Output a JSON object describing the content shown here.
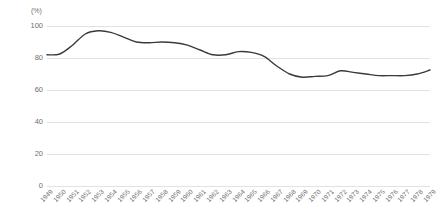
{
  "chart_data": {
    "type": "line",
    "title": "",
    "subtitle": "",
    "xlabel": "",
    "ylabel": "",
    "yunit": "(%)",
    "ylim": [
      0,
      100
    ],
    "yticks": [
      0,
      20,
      40,
      60,
      80,
      100
    ],
    "ytick_labels": [
      "0",
      "20",
      "40",
      "60",
      "80",
      "100"
    ],
    "grid": true,
    "legend": "none",
    "categories": [
      "1949",
      "1950",
      "1951",
      "1952",
      "1953",
      "1954",
      "1955",
      "1956",
      "1957",
      "1958",
      "1959",
      "1960",
      "1961",
      "1962",
      "1963",
      "1964",
      "1965",
      "1966",
      "1967",
      "1968",
      "1969",
      "1970",
      "1971",
      "1972",
      "1973",
      "1974",
      "1975",
      "1976",
      "1977",
      "1978",
      "1979"
    ],
    "series": [
      {
        "name": "",
        "color": "#3a3a3a",
        "values": [
          82,
          82.5,
          88,
          95,
          97,
          96,
          93,
          90,
          89.5,
          90,
          89.5,
          88,
          85,
          82,
          82,
          84,
          83.5,
          81,
          75,
          70,
          68,
          68.5,
          69,
          72,
          71,
          70,
          69,
          69,
          69,
          70,
          72.5
        ]
      }
    ]
  }
}
